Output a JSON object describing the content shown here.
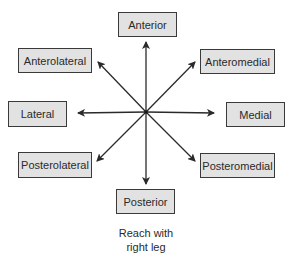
{
  "diagram": {
    "center": [
      146,
      112
    ],
    "directions": [
      {
        "label": "Anterior",
        "box": [
          118,
          12,
          59,
          25
        ],
        "tip": [
          146,
          42
        ]
      },
      {
        "label": "Anteromedial",
        "box": [
          200,
          49,
          75,
          25
        ],
        "tip": [
          195,
          62
        ]
      },
      {
        "label": "Medial",
        "box": [
          226,
          102,
          59,
          25
        ],
        "tip": [
          214,
          113
        ]
      },
      {
        "label": "Posteromedial",
        "box": [
          200,
          153,
          75,
          25
        ],
        "tip": [
          195,
          161
        ]
      },
      {
        "label": "Posterior",
        "box": [
          116,
          189,
          59,
          25
        ],
        "tip": [
          146,
          184
        ]
      },
      {
        "label": "Posterolateral",
        "box": [
          18,
          152,
          74,
          26
        ],
        "tip": [
          97,
          161
        ]
      },
      {
        "label": "Lateral",
        "box": [
          8,
          101,
          59,
          26
        ],
        "tip": [
          78,
          113
        ]
      },
      {
        "label": "Anterolateral",
        "box": [
          18,
          48,
          74,
          25
        ],
        "tip": [
          98,
          62
        ]
      }
    ],
    "caption_line1": "Reach with",
    "caption_line2": "right leg",
    "colors": {
      "box_fill": "#e2e2e2",
      "box_border": "#3a3a3a",
      "arrow": "#2a2a2a",
      "text": "#2a2a2a"
    }
  }
}
